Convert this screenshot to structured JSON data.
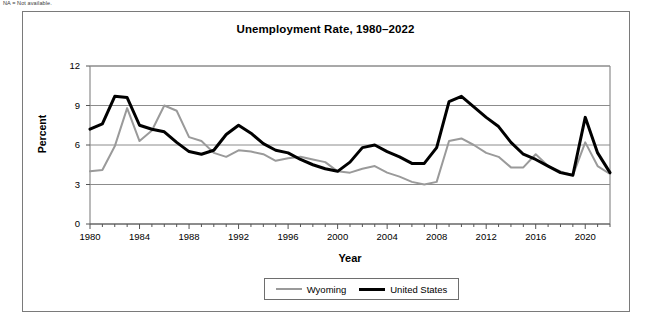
{
  "note": "NA = Not available.",
  "chart_data": {
    "type": "line",
    "title": "Unemployment Rate, 1980–2022",
    "xlabel": "Year",
    "ylabel": "Percent",
    "xlim": [
      1980,
      2022
    ],
    "ylim": [
      0,
      12
    ],
    "yticks": [
      "0",
      "3",
      "6",
      "9",
      "12"
    ],
    "ytick_values": [
      0,
      3,
      6,
      9,
      12
    ],
    "xticks": [
      "1980",
      "1984",
      "1988",
      "1992",
      "1996",
      "2000",
      "2004",
      "2008",
      "2012",
      "2016",
      "2020"
    ],
    "xtick_values": [
      1980,
      1984,
      1988,
      1992,
      1996,
      2000,
      2004,
      2008,
      2012,
      2016,
      2020
    ],
    "minor_tick_interval": 1,
    "grid": "horizontal",
    "legend_position": "bottom",
    "x": [
      1980,
      1981,
      1982,
      1983,
      1984,
      1985,
      1986,
      1987,
      1988,
      1989,
      1990,
      1991,
      1992,
      1993,
      1994,
      1995,
      1996,
      1997,
      1998,
      1999,
      2000,
      2001,
      2002,
      2003,
      2004,
      2005,
      2006,
      2007,
      2008,
      2009,
      2010,
      2011,
      2012,
      2013,
      2014,
      2015,
      2016,
      2017,
      2018,
      2019,
      2020,
      2021,
      2022
    ],
    "series": [
      {
        "name": "Wyoming",
        "color": "#9a9a9a",
        "width": 2,
        "values": [
          4.0,
          4.1,
          5.9,
          8.8,
          6.3,
          7.1,
          9.0,
          8.6,
          6.6,
          6.3,
          5.4,
          5.1,
          5.6,
          5.5,
          5.3,
          4.8,
          5.0,
          5.1,
          4.9,
          4.7,
          4.0,
          3.9,
          4.2,
          4.4,
          3.9,
          3.6,
          3.2,
          3.0,
          3.2,
          6.3,
          6.5,
          6.0,
          5.4,
          5.1,
          4.3,
          4.3,
          5.3,
          4.4,
          4.0,
          3.7,
          6.2,
          4.4,
          3.8
        ]
      },
      {
        "name": "United States",
        "color": "#000000",
        "width": 3,
        "values": [
          7.2,
          7.6,
          9.7,
          9.6,
          7.5,
          7.2,
          7.0,
          6.2,
          5.5,
          5.3,
          5.6,
          6.8,
          7.5,
          6.9,
          6.1,
          5.6,
          5.4,
          4.9,
          4.5,
          4.2,
          4.0,
          4.7,
          5.8,
          6.0,
          5.5,
          5.1,
          4.6,
          4.6,
          5.8,
          9.3,
          9.7,
          8.9,
          8.1,
          7.4,
          6.2,
          5.3,
          4.9,
          4.4,
          3.9,
          3.7,
          8.1,
          5.4,
          3.9
        ]
      }
    ]
  }
}
